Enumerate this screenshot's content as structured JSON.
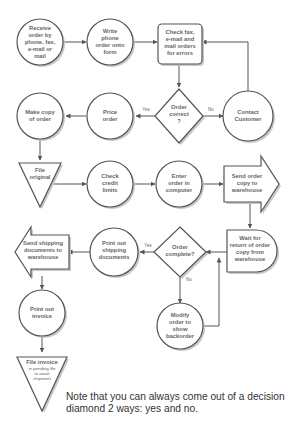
{
  "diagram": {
    "nodes": {
      "receive_order": {
        "lines": [
          "Receive",
          "order by",
          "phone, fax,",
          "e-mail or",
          "mail"
        ],
        "shape": "circle"
      },
      "write_phone_order": {
        "lines": [
          "Write",
          "phone",
          "order onto",
          "form"
        ],
        "shape": "circle"
      },
      "check_orders": {
        "lines": [
          "Check fax,",
          "e-mail and",
          "mail orders",
          "for errors"
        ],
        "shape": "rounded-rect"
      },
      "order_correct": {
        "lines": [
          "Order",
          "correct",
          "?"
        ],
        "shape": "diamond"
      },
      "contact_customer": {
        "lines": [
          "Contact",
          "Customer"
        ],
        "shape": "circle"
      },
      "price_order": {
        "lines": [
          "Price",
          "order"
        ],
        "shape": "circle"
      },
      "make_copy": {
        "lines": [
          "Make copy",
          "of order"
        ],
        "shape": "circle"
      },
      "file_original": {
        "lines": [
          "File",
          "original"
        ],
        "shape": "triangle"
      },
      "check_credit": {
        "lines": [
          "Check",
          "credit",
          "limits"
        ],
        "shape": "circle"
      },
      "enter_order": {
        "lines": [
          "Enter",
          "order in",
          "computer"
        ],
        "shape": "circle"
      },
      "send_order_copy": {
        "lines": [
          "Send order",
          "copy to",
          "warehouse"
        ],
        "shape": "arrow-right"
      },
      "wait_return": {
        "lines": [
          "Wait for",
          "return of order",
          "copy from",
          "warehouse"
        ],
        "shape": "delay"
      },
      "order_complete": {
        "lines": [
          "Order",
          "complete?"
        ],
        "shape": "diamond"
      },
      "print_shipping": {
        "lines": [
          "Print out",
          "shipping",
          "documents"
        ],
        "shape": "circle"
      },
      "send_shipping": {
        "lines": [
          "Send shipping",
          "documents to",
          "warehouse"
        ],
        "shape": "arrow-left"
      },
      "modify_order": {
        "lines": [
          "Modify",
          "order to",
          "show",
          "backorder"
        ],
        "shape": "circle"
      },
      "print_invoice": {
        "lines": [
          "Print out",
          "invoice"
        ],
        "shape": "circle"
      },
      "file_invoice": {
        "title": "File invoice",
        "lines": [
          "in pending file",
          "to await",
          "shipment"
        ],
        "shape": "triangle"
      }
    },
    "branch_labels": {
      "correct_yes": "Yes",
      "correct_no": "No",
      "complete_yes": "Yes",
      "complete_no": "No"
    },
    "note": "Note that you can always come out of a decision diamond 2 ways: yes and no."
  }
}
